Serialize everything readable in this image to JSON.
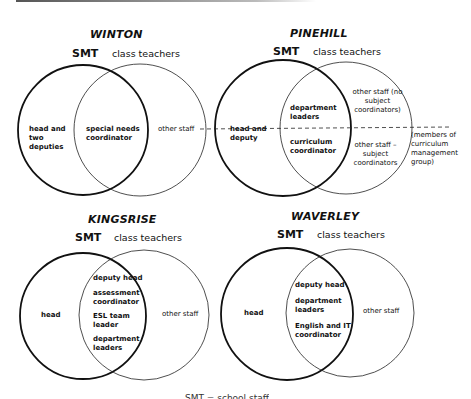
{
  "diagrams": [
    {
      "title": "WINTON",
      "smt_label": "SMT",
      "class_teachers_label": "class teachers",
      "left_only": "head and two deputies",
      "overlap": [
        "special needs coordinator"
      ],
      "right_only": "other staff"
    },
    {
      "title": "PINEHILL",
      "smt_label": "SMT",
      "class_teachers_label": "class teachers",
      "left_only": "head and deputy",
      "overlap_upper": "department leaders",
      "overlap_lower": "curriculum coordinator",
      "right_upper": "other staff (no subject coordinators)",
      "right_lower": "other staff – subject coordinators",
      "dashed_line_note": "(members of curriculum management group)"
    },
    {
      "title": "KINGSRISE",
      "smt_label": "SMT",
      "class_teachers_label": "class teachers",
      "left_only": "head",
      "overlap": [
        "deputy head",
        "assessment coordinator",
        "ESL team leader",
        "department leaders"
      ],
      "right_only": "other staff"
    },
    {
      "title": "WAVERLEY",
      "smt_label": "SMT",
      "class_teachers_label": "class teachers",
      "left_only": "head",
      "overlap": [
        "deputy head",
        "department leaders",
        "English and IT coordinator"
      ],
      "right_only": "other staff"
    }
  ],
  "caption": "SMT = school staff"
}
